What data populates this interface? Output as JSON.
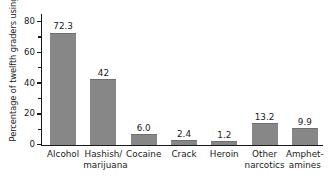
{
  "chart_data": {
    "type": "bar",
    "title": "",
    "subtitle": "",
    "xlabel": "",
    "ylabel": "Percentage of twelfth graders using",
    "ylim": [
      0,
      85
    ],
    "yticks": [
      0,
      20,
      40,
      60,
      80
    ],
    "ytick_labels": [
      "0",
      "20",
      "40",
      "60",
      "80"
    ],
    "yminor_ticks": [
      10,
      30,
      50,
      70
    ],
    "grid": false,
    "legend": null,
    "bar_color": "#878787",
    "axis_color": "#1a1a1a",
    "background": "#ffffff",
    "categories": [
      "Alcohol",
      "Hashish/ marijuana",
      "Cocaine",
      "Crack",
      "Heroin",
      "Other narcotics",
      "Amphet- amines"
    ],
    "category_lines": [
      [
        "Alcohol",
        ""
      ],
      [
        "Hashish/",
        "marijuana"
      ],
      [
        "Cocaine",
        ""
      ],
      [
        "Crack",
        ""
      ],
      [
        "Heroin",
        ""
      ],
      [
        "Other",
        "narcotics"
      ],
      [
        "Amphet-",
        "amines"
      ]
    ],
    "values": [
      72.3,
      42,
      6.0,
      2.4,
      1.2,
      13.2,
      9.9
    ],
    "value_labels": [
      "72.3",
      "42",
      "6.0",
      "2.4",
      "1.2",
      "13.2",
      "9.9"
    ]
  }
}
